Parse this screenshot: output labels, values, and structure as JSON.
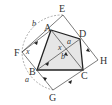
{
  "diagram": {
    "type": "geometry",
    "colors": {
      "stroke": "#333333",
      "fill": "#e6e6e6",
      "arc": "#999999"
    },
    "points": {
      "A": {
        "label": "A",
        "x": 51,
        "y": 30
      },
      "B": {
        "label": "B",
        "x": 37,
        "y": 70
      },
      "C": {
        "label": "C",
        "x": 83,
        "y": 70
      },
      "D": {
        "label": "D",
        "x": 80,
        "y": 39
      },
      "E": {
        "label": "E",
        "x": 63,
        "y": 15
      },
      "F": {
        "label": "F",
        "x": 22,
        "y": 52
      },
      "G": {
        "label": "G",
        "x": 53,
        "y": 90
      },
      "H": {
        "label": "H",
        "x": 98,
        "y": 60
      }
    },
    "variables": {
      "a_top": "a",
      "b_mid": "b",
      "x_mid": "x",
      "x_f": "x",
      "b_arc": "b",
      "a_arc": "a"
    }
  }
}
